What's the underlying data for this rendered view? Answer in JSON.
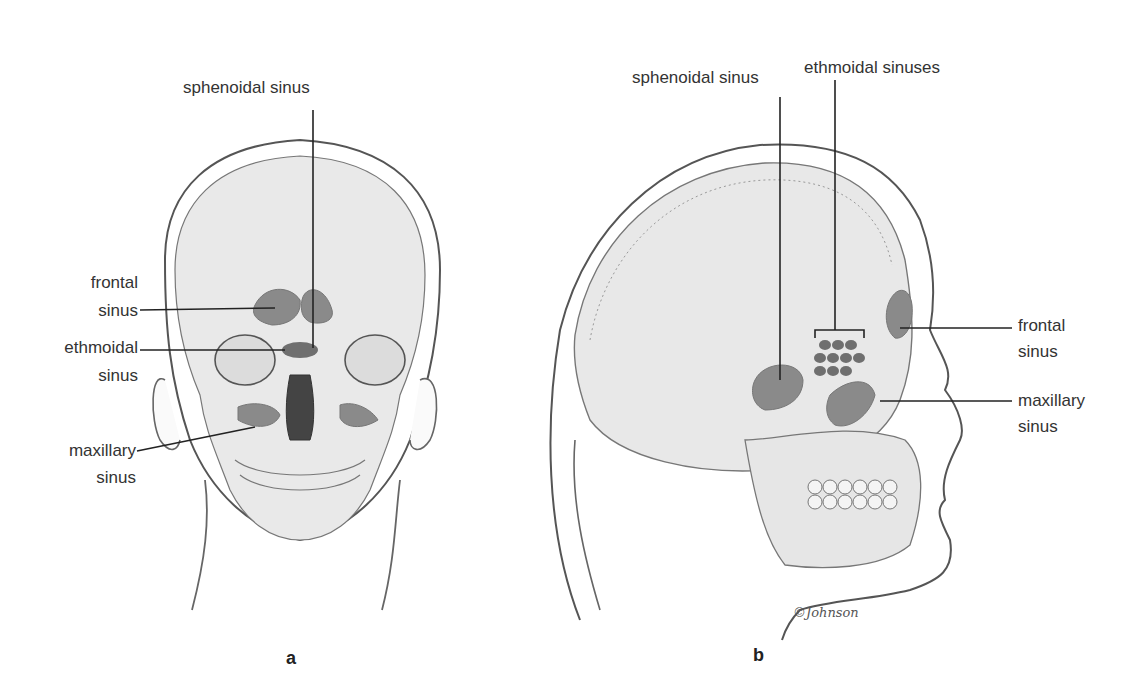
{
  "figure": {
    "panels": [
      {
        "id": "a",
        "view": "frontal",
        "letter": "a",
        "labels": {
          "sphenoidal": "sphenoidal  sinus",
          "frontal_1": "frontal",
          "frontal_2": "sinus",
          "ethmoidal_1": "ethmoidal",
          "ethmoidal_2": "sinus",
          "maxillary_1": "maxillary",
          "maxillary_2": "sinus"
        }
      },
      {
        "id": "b",
        "view": "lateral",
        "letter": "b",
        "labels": {
          "sphenoidal": "sphenoidal sinus",
          "ethmoidal": "ethmoidal  sinuses",
          "frontal_1": "frontal",
          "frontal_2": "sinus",
          "maxillary_1": "maxillary",
          "maxillary_2": "sinus"
        },
        "signature": "©Johnson"
      }
    ],
    "colors": {
      "outline": "#555555",
      "bone": "#e6e6e6",
      "sinus": "#8a8a8a",
      "leader": "#222222"
    }
  }
}
